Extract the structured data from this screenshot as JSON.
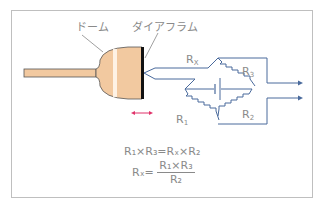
{
  "labels": {
    "dome": "ドーム",
    "diaphragm": "ダイアフラム",
    "rx": "R",
    "rx_sub": "X",
    "r1": "R",
    "r1_sub": "1",
    "r2": "R",
    "r2_sub": "2",
    "r3": "R",
    "r3_sub": "3"
  },
  "equations": {
    "eq1": "R₁×R₃=Rₓ×R₂",
    "eq2_lhs": "Rₓ=",
    "eq2_num": "R₁×R₃",
    "eq2_den": "R₂"
  },
  "colors": {
    "dome_fill": "#f2c9a0",
    "wire": "#4a6a9c",
    "arrow": "#e0336a",
    "diaphragm": "#111111",
    "text": "#8a8a8a"
  }
}
